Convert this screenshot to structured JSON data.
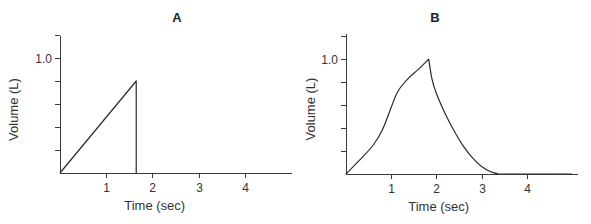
{
  "chart_data": [
    {
      "id": "A",
      "type": "line",
      "title": "A",
      "xlabel": "Time (sec)",
      "ylabel": "Volume (L)",
      "xlim": [
        0,
        5
      ],
      "ylim": [
        0,
        1.2
      ],
      "xticks": [
        1,
        2,
        3,
        4
      ],
      "xtick_labels": [
        "1",
        "2",
        "3",
        "4"
      ],
      "yticks": [
        0.2,
        0.4,
        0.6,
        0.8,
        1.0,
        1.2
      ],
      "ytick_labels": [
        "",
        "",
        "",
        "",
        "1.0",
        ""
      ],
      "grid": false,
      "legend": null,
      "series": [
        {
          "name": "Volume",
          "x": [
            0,
            1.65,
            1.65
          ],
          "y": [
            0,
            0.8,
            0
          ]
        }
      ]
    },
    {
      "id": "B",
      "type": "line",
      "title": "B",
      "xlabel": "Time (sec)",
      "ylabel": "Volume (L)",
      "xlim": [
        0,
        5
      ],
      "ylim": [
        0,
        1.2
      ],
      "xticks": [
        1,
        2,
        3,
        4
      ],
      "xtick_labels": [
        "1",
        "2",
        "3",
        "4"
      ],
      "yticks": [
        0.2,
        0.4,
        0.6,
        0.8,
        1.0,
        1.2
      ],
      "ytick_labels": [
        "",
        "",
        "",
        "",
        "1.0",
        ""
      ],
      "grid": false,
      "legend": null,
      "series": [
        {
          "name": "Volume",
          "x": [
            0,
            0.3,
            0.6,
            0.8,
            1.0,
            1.1,
            1.2,
            1.4,
            1.6,
            1.83,
            1.9,
            2.0,
            2.2,
            2.4,
            2.6,
            2.8,
            3.0,
            3.2,
            3.35,
            3.45,
            5.0
          ],
          "y": [
            0,
            0.12,
            0.25,
            0.38,
            0.58,
            0.68,
            0.75,
            0.84,
            0.91,
            1.0,
            0.83,
            0.7,
            0.52,
            0.37,
            0.24,
            0.14,
            0.065,
            0.02,
            0.004,
            0,
            0
          ]
        }
      ]
    }
  ]
}
